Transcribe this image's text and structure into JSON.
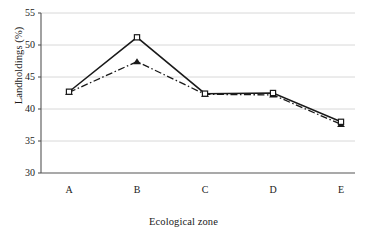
{
  "chart_data": {
    "type": "line",
    "title": "",
    "xlabel": "Ecological zone",
    "ylabel": "Landholdings (%)",
    "categories": [
      "A",
      "B",
      "C",
      "D",
      "E"
    ],
    "ylim": [
      30,
      55
    ],
    "yticks": [
      "30",
      "35",
      "40",
      "45",
      "50",
      "55"
    ],
    "grid": true,
    "legend": "none",
    "series": [
      {
        "name": "series-1",
        "line_style": "solid",
        "marker": "open-square",
        "color": "#1a1a1a",
        "values": [
          42.7,
          51.2,
          42.4,
          42.5,
          38.0
        ]
      },
      {
        "name": "series-2",
        "line_style": "dash-dot",
        "marker": "filled-triangle",
        "color": "#1a1a1a",
        "values": [
          42.6,
          47.4,
          42.3,
          42.2,
          37.6
        ]
      }
    ]
  },
  "axes": {
    "frame_color": "#555555",
    "grid_color": "#d8d8d8"
  }
}
